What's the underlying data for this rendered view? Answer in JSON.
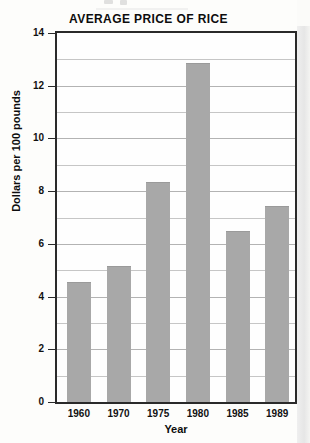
{
  "chart_data": {
    "type": "bar",
    "title": "AVERAGE PRICE OF RICE",
    "xlabel": "Year",
    "ylabel": "Dollars per 100 pounds",
    "categories": [
      "1960",
      "1970",
      "1975",
      "1980",
      "1985",
      "1989"
    ],
    "values": [
      4.55,
      5.15,
      8.35,
      12.85,
      6.5,
      7.45
    ],
    "ylim": [
      0,
      14
    ],
    "ytick_step": 2,
    "ytick_labels": [
      "0",
      "2",
      "4",
      "6",
      "8",
      "10",
      "12",
      "14"
    ],
    "gridline_step": 1,
    "grid": true,
    "legend": null,
    "bar_color": "#a8a8a8",
    "frame_color": "#2a2a2a",
    "gridline_color": "#b3b3b3"
  }
}
